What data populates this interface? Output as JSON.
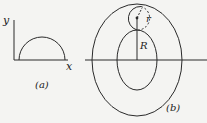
{
  "figure_a": {
    "y_label": "y",
    "x_label": "x",
    "caption": "(a)"
  },
  "figure_b": {
    "small_radius_label": "r",
    "large_radius_label": "R",
    "caption": "(b)"
  },
  "colors": {
    "stroke": "#2a2a2a",
    "background": "#f4f4f2"
  }
}
